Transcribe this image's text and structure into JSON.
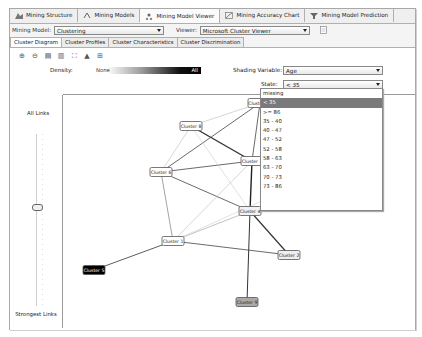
{
  "top_tabs": [
    {
      "label": "Mining Structure",
      "icon": "mining-structure-icon",
      "active": false
    },
    {
      "label": "Mining Models",
      "icon": "mining-models-icon",
      "active": false
    },
    {
      "label": "Mining Model Viewer",
      "icon": "mining-model-viewer-icon",
      "active": true
    },
    {
      "label": "Mining Accuracy Chart",
      "icon": "accuracy-chart-icon",
      "active": false
    },
    {
      "label": "Mining Model Prediction",
      "icon": "prediction-icon",
      "active": false
    }
  ],
  "model_row": {
    "mining_model_label": "Mining Model:",
    "mining_model_value": "Clustering",
    "viewer_label": "Viewer:",
    "viewer_value": "Microsoft Cluster Viewer"
  },
  "sub_tabs": [
    {
      "label": "Cluster Diagram",
      "active": true
    },
    {
      "label": "Cluster Profiles",
      "active": false
    },
    {
      "label": "Cluster Characteristics",
      "active": false
    },
    {
      "label": "Cluster Discrimination",
      "active": false
    }
  ],
  "toolbar": {
    "icons": [
      "zoom-in-icon",
      "zoom-out-icon",
      "copy-graph-view-icon",
      "copy-entire-graph-icon",
      "fit-to-window-icon",
      "find-node-icon",
      "layout-icon"
    ]
  },
  "density": {
    "label": "Density:",
    "min_label": "None",
    "max_label": "All"
  },
  "shading": {
    "variable_label": "Shading Variable:",
    "variable_value": "Age",
    "state_label": "State:",
    "state_value": "< 35"
  },
  "state_options": [
    "missing",
    "< 35",
    ">= 86",
    "35 - 40",
    "40 - 47",
    "47 - 52",
    "52 - 58",
    "58 - 63",
    "63 - 70",
    "70 - 73",
    "73 - 86"
  ],
  "state_selected_index": 1,
  "links_slider": {
    "top_label": "All Links",
    "bottom_label": "Strongest Links"
  },
  "clusters": [
    {
      "id": "c10",
      "label": "Cluster 10",
      "x": 260,
      "y": 103,
      "fill": "#ffffff",
      "text": "#222"
    },
    {
      "id": "c8",
      "label": "Cluster 8",
      "x": 191,
      "y": 126,
      "fill": "#ffffff",
      "text": "#222"
    },
    {
      "id": "c3",
      "label": "Cluster 3",
      "x": 252,
      "y": 161,
      "fill": "#ffffff",
      "text": "#222"
    },
    {
      "id": "c6",
      "label": "Cluster 6",
      "x": 161,
      "y": 172,
      "fill": "#ffffff",
      "text": "#222"
    },
    {
      "id": "c7",
      "label": "Cluster 7",
      "x": 335,
      "y": 168,
      "fill": "#555555",
      "text": "#fff"
    },
    {
      "id": "c4",
      "label": "Cluster 4",
      "x": 250,
      "y": 211,
      "fill": "#f2f2f2",
      "text": "#222"
    },
    {
      "id": "c1",
      "label": "Cluster 1",
      "x": 173,
      "y": 241,
      "fill": "#ffffff",
      "text": "#222"
    },
    {
      "id": "c2",
      "label": "Cluster 2",
      "x": 289,
      "y": 255,
      "fill": "#eeeeee",
      "text": "#222"
    },
    {
      "id": "c5",
      "label": "Cluster 5",
      "x": 94,
      "y": 270,
      "fill": "#000000",
      "text": "#fff"
    },
    {
      "id": "c9",
      "label": "Cluster 9",
      "x": 247,
      "y": 302,
      "fill": "#aaaaaa",
      "text": "#222"
    }
  ],
  "links": [
    {
      "from": "c8",
      "to": "c3",
      "w": 1.4,
      "c": "#333"
    },
    {
      "from": "c10",
      "to": "c3",
      "w": 0.8,
      "c": "#444"
    },
    {
      "from": "c10",
      "to": "c6",
      "w": 0.8,
      "c": "#444"
    },
    {
      "from": "c10",
      "to": "c8",
      "w": 0.6,
      "c": "#bbb"
    },
    {
      "from": "c6",
      "to": "c3",
      "w": 0.8,
      "c": "#444"
    },
    {
      "from": "c6",
      "to": "c4",
      "w": 0.8,
      "c": "#444"
    },
    {
      "from": "c6",
      "to": "c1",
      "w": 0.6,
      "c": "#666"
    },
    {
      "from": "c8",
      "to": "c6",
      "w": 0.6,
      "c": "#bbb"
    },
    {
      "from": "c8",
      "to": "c4",
      "w": 0.6,
      "c": "#ccc"
    },
    {
      "from": "c3",
      "to": "c4",
      "w": 1.4,
      "c": "#222"
    },
    {
      "from": "c3",
      "to": "c7",
      "w": 1.0,
      "c": "#333"
    },
    {
      "from": "c3",
      "to": "c1",
      "w": 0.6,
      "c": "#bbb"
    },
    {
      "from": "c4",
      "to": "c1",
      "w": 0.6,
      "c": "#999"
    },
    {
      "from": "c7",
      "to": "c1",
      "w": 0.6,
      "c": "#ccc"
    },
    {
      "from": "c4",
      "to": "c2",
      "w": 1.2,
      "c": "#333"
    },
    {
      "from": "c4",
      "to": "c9",
      "w": 1.0,
      "c": "#333"
    },
    {
      "from": "c1",
      "to": "c2",
      "w": 0.8,
      "c": "#444"
    },
    {
      "from": "c1",
      "to": "c5",
      "w": 0.8,
      "c": "#333"
    }
  ]
}
